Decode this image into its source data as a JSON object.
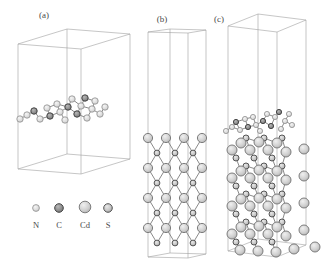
{
  "figure": {
    "background": "#ffffff",
    "line_color": "#a0a0a0",
    "bond_color": "#8a8a8a",
    "atom_types": {
      "N": {
        "stops": [
          "#f5f5f5",
          "#dcdcdc",
          "#bdbdbd"
        ],
        "stroke": "#8f8f8f",
        "stroke_w": 0.8
      },
      "C": {
        "stops": [
          "#b8b8b8",
          "#8d8d8d",
          "#686868"
        ],
        "stroke": "#454545",
        "stroke_w": 1
      },
      "Cd": {
        "stops": [
          "#f0f0f0",
          "#cfcfcf",
          "#a3a3a3"
        ],
        "stroke": "#7d7d7d",
        "stroke_w": 1
      },
      "S": {
        "stops": [
          "#e8e8e8",
          "#c4c4c4",
          "#8f8f8f"
        ],
        "stroke": "#565656",
        "stroke_w": 1
      }
    },
    "panels": [
      {
        "id": "a",
        "label": "(a)",
        "box_lines": [
          [
            [
              18,
              44
            ],
            [
              67,
              29
            ],
            [
              130,
              34
            ],
            [
              81,
              49
            ],
            [
              18,
              44
            ]
          ],
          [
            [
              18,
              44
            ],
            [
              18,
              169
            ]
          ],
          [
            [
              67,
              29
            ],
            [
              67,
              154
            ]
          ],
          [
            [
              130,
              34
            ],
            [
              130,
              159
            ]
          ],
          [
            [
              81,
              49
            ],
            [
              81,
              174
            ]
          ],
          [
            [
              18,
              169
            ],
            [
              67,
              154
            ],
            [
              130,
              159
            ],
            [
              81,
              174
            ],
            [
              18,
              169
            ]
          ]
        ],
        "atom_groups": [
          {
            "name": "g-C3N4-monolayer",
            "bond_mode": "all",
            "bond_max": 11.5,
            "radii": {
              "N": 3.2,
              "C": 3.2
            },
            "atoms": [
              [
                20,
                119,
                "N"
              ],
              [
                27,
                115,
                "N"
              ],
              [
                34,
                111,
                "C"
              ],
              [
                40,
                119,
                "N"
              ],
              [
                47,
                108,
                "N"
              ],
              [
                50,
                116,
                "C"
              ],
              [
                57,
                104,
                "N"
              ],
              [
                60,
                112,
                "N"
              ],
              [
                65,
                120,
                "N"
              ],
              [
                68,
                107,
                "C"
              ],
              [
                72,
                99,
                "N"
              ],
              [
                77,
                114,
                "C"
              ],
              [
                81,
                106,
                "N"
              ],
              [
                85,
                98,
                "C"
              ],
              [
                87,
                118,
                "N"
              ],
              [
                92,
                109,
                "N"
              ],
              [
                95,
                101,
                "N"
              ],
              [
                100,
                114,
                "N"
              ],
              [
                105,
                107,
                "N"
              ]
            ]
          }
        ]
      },
      {
        "id": "b",
        "label": "(b)",
        "box_lines": [
          [
            [
              148,
              32
            ],
            [
              170,
              29
            ],
            [
              206,
              30
            ],
            [
              188,
              33
            ],
            [
              148,
              32
            ]
          ],
          [
            [
              148,
              32
            ],
            [
              148,
              257
            ]
          ],
          [
            [
              170,
              29
            ],
            [
              170,
              253
            ]
          ],
          [
            [
              206,
              30
            ],
            [
              206,
              254
            ]
          ],
          [
            [
              188,
              33
            ],
            [
              188,
              258
            ]
          ],
          [
            [
              148,
              257
            ],
            [
              170,
              253
            ],
            [
              206,
              254
            ],
            [
              188,
              258
            ],
            [
              148,
              257
            ]
          ]
        ],
        "atom_groups": [
          {
            "name": "CdS-slab",
            "bond_mode": "CdS",
            "bond_max": 18,
            "radii": {
              "Cd": 4.6,
              "S": 2.9
            },
            "atoms": [
              [
                148,
                138,
                "Cd"
              ],
              [
                166,
                138,
                "Cd"
              ],
              [
                184,
                138,
                "Cd"
              ],
              [
                202,
                138,
                "Cd"
              ],
              [
                148,
                168,
                "Cd"
              ],
              [
                166,
                168,
                "Cd"
              ],
              [
                184,
                168,
                "Cd"
              ],
              [
                202,
                168,
                "Cd"
              ],
              [
                148,
                198,
                "Cd"
              ],
              [
                166,
                198,
                "Cd"
              ],
              [
                184,
                198,
                "Cd"
              ],
              [
                202,
                198,
                "Cd"
              ],
              [
                148,
                228,
                "Cd"
              ],
              [
                166,
                228,
                "Cd"
              ],
              [
                184,
                228,
                "Cd"
              ],
              [
                202,
                228,
                "Cd"
              ],
              [
                157,
                153,
                "S"
              ],
              [
                175,
                153,
                "S"
              ],
              [
                193,
                153,
                "S"
              ],
              [
                157,
                183,
                "S"
              ],
              [
                175,
                183,
                "S"
              ],
              [
                193,
                183,
                "S"
              ],
              [
                157,
                213,
                "S"
              ],
              [
                175,
                213,
                "S"
              ],
              [
                193,
                213,
                "S"
              ],
              [
                157,
                243,
                "S"
              ],
              [
                175,
                243,
                "S"
              ],
              [
                193,
                243,
                "S"
              ]
            ]
          }
        ]
      },
      {
        "id": "c",
        "label": "(c)",
        "box_lines": [
          [
            [
              228,
              26
            ],
            [
              258,
              14
            ],
            [
              306,
              20
            ],
            [
              277,
              32
            ],
            [
              228,
              26
            ]
          ],
          [
            [
              228,
              26
            ],
            [
              228,
              251
            ]
          ],
          [
            [
              258,
              14
            ],
            [
              258,
              239
            ]
          ],
          [
            [
              306,
              20
            ],
            [
              306,
              245
            ]
          ],
          [
            [
              277,
              32
            ],
            [
              277,
              257
            ]
          ],
          [
            [
              228,
              251
            ],
            [
              258,
              239
            ],
            [
              306,
              245
            ],
            [
              277,
              257
            ],
            [
              228,
              251
            ]
          ]
        ],
        "atom_groups": [
          {
            "name": "g-C3N4-monolayer",
            "bond_mode": "all",
            "bond_max": 10,
            "radii": {
              "N": 2.6,
              "C": 2.6
            },
            "atoms": [
              [
                226,
                131,
                "N"
              ],
              [
                232,
                127,
                "N"
              ],
              [
                236,
                122,
                "C"
              ],
              [
                240,
                130,
                "N"
              ],
              [
                245,
                119,
                "N"
              ],
              [
                248,
                127,
                "C"
              ],
              [
                253,
                117,
                "N"
              ],
              [
                256,
                125,
                "N"
              ],
              [
                260,
                131,
                "N"
              ],
              [
                263,
                121,
                "C"
              ],
              [
                267,
                114,
                "N"
              ],
              [
                271,
                126,
                "C"
              ],
              [
                275,
                117,
                "N"
              ],
              [
                279,
                112,
                "C"
              ],
              [
                281,
                129,
                "N"
              ],
              [
                285,
                121,
                "N"
              ],
              [
                289,
                114,
                "N"
              ],
              [
                292,
                125,
                "N"
              ]
            ]
          },
          {
            "name": "CdS-slab",
            "bond_mode": "CdS",
            "bond_max": 15,
            "radii": {
              "Cd": 5,
              "S": 3
            },
            "atoms": [
              [
                232,
                150,
                "Cd"
              ],
              [
                241,
                143,
                "Cd"
              ],
              [
                250,
                150,
                "Cd"
              ],
              [
                259,
                142,
                "Cd"
              ],
              [
                268,
                150,
                "Cd"
              ],
              [
                277,
                143,
                "Cd"
              ],
              [
                286,
                152,
                "Cd"
              ],
              [
                232,
                178,
                "Cd"
              ],
              [
                241,
                171,
                "Cd"
              ],
              [
                250,
                178,
                "Cd"
              ],
              [
                259,
                170,
                "Cd"
              ],
              [
                268,
                178,
                "Cd"
              ],
              [
                277,
                171,
                "Cd"
              ],
              [
                286,
                180,
                "Cd"
              ],
              [
                232,
                206,
                "Cd"
              ],
              [
                241,
                199,
                "Cd"
              ],
              [
                250,
                206,
                "Cd"
              ],
              [
                259,
                198,
                "Cd"
              ],
              [
                268,
                206,
                "Cd"
              ],
              [
                277,
                199,
                "Cd"
              ],
              [
                286,
                208,
                "Cd"
              ],
              [
                232,
                234,
                "Cd"
              ],
              [
                241,
                227,
                "Cd"
              ],
              [
                250,
                234,
                "Cd"
              ],
              [
                259,
                226,
                "Cd"
              ],
              [
                268,
                234,
                "Cd"
              ],
              [
                277,
                227,
                "Cd"
              ],
              [
                286,
                236,
                "Cd"
              ],
              [
                240,
                250,
                "Cd"
              ],
              [
                258,
                251,
                "Cd"
              ],
              [
                276,
                252,
                "Cd"
              ],
              [
                294,
                249,
                "Cd"
              ],
              [
                304,
                149,
                "Cd"
              ],
              [
                304,
                176,
                "Cd"
              ],
              [
                304,
                203,
                "Cd"
              ],
              [
                304,
                230,
                "Cd"
              ],
              [
                315,
                247,
                "Cd"
              ],
              [
                236,
                158,
                "S"
              ],
              [
                254,
                158,
                "S"
              ],
              [
                272,
                158,
                "S"
              ],
              [
                246,
                138,
                "S"
              ],
              [
                264,
                138,
                "S"
              ],
              [
                282,
                138,
                "S"
              ],
              [
                236,
                186,
                "S"
              ],
              [
                254,
                186,
                "S"
              ],
              [
                272,
                186,
                "S"
              ],
              [
                246,
                166,
                "S"
              ],
              [
                264,
                166,
                "S"
              ],
              [
                282,
                166,
                "S"
              ],
              [
                236,
                214,
                "S"
              ],
              [
                254,
                214,
                "S"
              ],
              [
                272,
                214,
                "S"
              ],
              [
                246,
                194,
                "S"
              ],
              [
                264,
                194,
                "S"
              ],
              [
                282,
                194,
                "S"
              ],
              [
                236,
                242,
                "S"
              ],
              [
                254,
                242,
                "S"
              ],
              [
                272,
                242,
                "S"
              ],
              [
                246,
                222,
                "S"
              ],
              [
                264,
                222,
                "S"
              ],
              [
                282,
                222,
                "S"
              ]
            ]
          }
        ]
      }
    ]
  },
  "legend": {
    "items": [
      {
        "symbol": "N",
        "type": "N",
        "x": 36,
        "y": 208,
        "r": 3.4
      },
      {
        "symbol": "C",
        "type": "C",
        "x": 59,
        "y": 208,
        "r": 4.3
      },
      {
        "symbol": "Cd",
        "type": "Cd",
        "x": 85,
        "y": 207,
        "r": 5.8
      },
      {
        "symbol": "S",
        "type": "S",
        "x": 108,
        "y": 208,
        "r": 4.3
      }
    ]
  }
}
